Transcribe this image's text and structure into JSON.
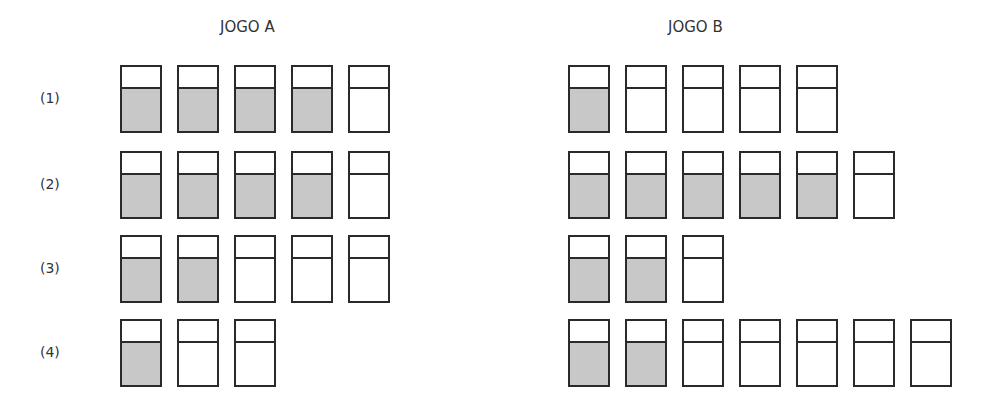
{
  "titles": {
    "a": "JOGO A",
    "b": "JOGO B"
  },
  "row_labels": [
    "(1)",
    "(2)",
    "(3)",
    "(4)"
  ],
  "colors": {
    "filled": "#c8c8c8",
    "border": "#2a2a2a"
  },
  "game_a": [
    {
      "total": 5,
      "filled": 4
    },
    {
      "total": 5,
      "filled": 4
    },
    {
      "total": 5,
      "filled": 2
    },
    {
      "total": 3,
      "filled": 1
    }
  ],
  "game_b": [
    {
      "total": 5,
      "filled": 1
    },
    {
      "total": 6,
      "filled": 5
    },
    {
      "total": 3,
      "filled": 2
    },
    {
      "total": 7,
      "filled": 2
    }
  ]
}
